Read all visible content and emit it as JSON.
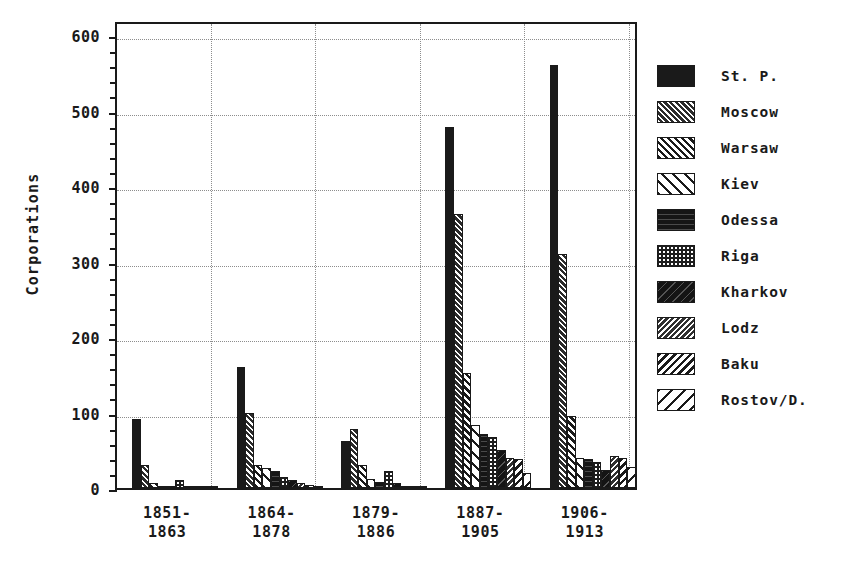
{
  "chart_data": {
    "type": "bar",
    "title": "",
    "xlabel": "",
    "ylabel": "Corporations",
    "ylim": [
      0,
      620
    ],
    "yticks": [
      0,
      100,
      200,
      300,
      400,
      500,
      600
    ],
    "ytick_labels": [
      "0",
      "100",
      "200",
      "300",
      "400",
      "500",
      "600"
    ],
    "grid": "dotted-both",
    "legend_position": "right",
    "categories": [
      "1851-\n1863",
      "1864-\n1878",
      "1879-\n1886",
      "1887-\n1905",
      "1906-\n1913"
    ],
    "category_lines": [
      [
        "1851-",
        "1863"
      ],
      [
        "1864-",
        "1878"
      ],
      [
        "1879-",
        "1886"
      ],
      [
        "1887-",
        "1905"
      ],
      [
        "1906-",
        "1913"
      ]
    ],
    "series": [
      {
        "name": "St. P.",
        "pattern": "solid",
        "values": [
          92,
          160,
          62,
          478,
          560
        ]
      },
      {
        "name": "Moscow",
        "pattern": "dense-fwd",
        "values": [
          30,
          100,
          78,
          363,
          310
        ]
      },
      {
        "name": "Warsaw",
        "pattern": "mid-fwd",
        "values": [
          6,
          30,
          30,
          152,
          95
        ]
      },
      {
        "name": "Kiev",
        "pattern": "wide-fwd",
        "values": [
          3,
          27,
          12,
          83,
          40
        ]
      },
      {
        "name": "Odessa",
        "pattern": "solid2",
        "values": [
          2,
          22,
          8,
          72,
          38
        ]
      },
      {
        "name": "Riga",
        "pattern": "dots",
        "values": [
          10,
          15,
          22,
          68,
          35
        ]
      },
      {
        "name": "Kharkov",
        "pattern": "solid3",
        "values": [
          2,
          10,
          6,
          50,
          24
        ]
      },
      {
        "name": "Lodz",
        "pattern": "dense-back",
        "values": [
          1,
          7,
          3,
          40,
          42
        ]
      },
      {
        "name": "Baku",
        "pattern": "mid-back",
        "values": [
          1,
          4,
          2,
          38,
          40
        ]
      },
      {
        "name": "Rostov/D.",
        "pattern": "wide-back",
        "values": [
          3,
          3,
          2,
          20,
          28
        ]
      }
    ]
  },
  "legend": {
    "items": [
      {
        "label": "St. P.",
        "pattern": "solid"
      },
      {
        "label": "Moscow",
        "pattern": "dense-fwd"
      },
      {
        "label": "Warsaw",
        "pattern": "mid-fwd"
      },
      {
        "label": "Kiev",
        "pattern": "wide-fwd"
      },
      {
        "label": "Odessa",
        "pattern": "solid2"
      },
      {
        "label": "Riga",
        "pattern": "dots"
      },
      {
        "label": "Kharkov",
        "pattern": "solid3"
      },
      {
        "label": "Lodz",
        "pattern": "dense-back"
      },
      {
        "label": "Baku",
        "pattern": "mid-back"
      },
      {
        "label": "Rostov/D.",
        "pattern": "wide-back"
      }
    ]
  },
  "colors": {
    "axis": "#1a1a1a",
    "grid": "#8d8d8d",
    "background": "#ffffff",
    "ink": "#1a1a1a"
  }
}
